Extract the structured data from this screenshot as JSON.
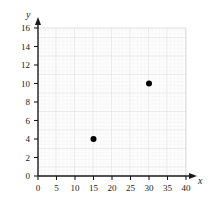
{
  "chart_data": {
    "type": "scatter",
    "title": "",
    "xlabel": "x",
    "ylabel": "y",
    "xlim": [
      0,
      40
    ],
    "ylim": [
      0,
      16
    ],
    "xticks": [
      0,
      5,
      10,
      15,
      20,
      25,
      30,
      35,
      40
    ],
    "yticks": [
      0,
      2,
      4,
      6,
      8,
      10,
      12,
      14,
      16
    ],
    "grid": true,
    "minor_grid": true,
    "legend": null,
    "points": [
      {
        "x": 15,
        "y": 4
      },
      {
        "x": 30,
        "y": 10
      }
    ],
    "series": [
      {
        "name": "",
        "x": [
          15,
          30
        ],
        "y": [
          4,
          10
        ]
      }
    ],
    "colors": {
      "point": "#000000",
      "axis": "#1a1a1a",
      "grid_major": "#dcdcdc",
      "grid_minor": "#eeeeee",
      "plot_background": "#fdfdfd",
      "page_background": "#ffffff"
    }
  }
}
